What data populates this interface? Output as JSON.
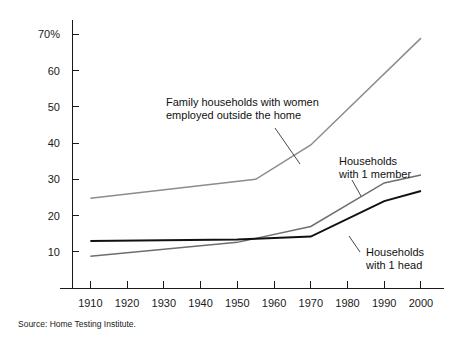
{
  "source_note": "Source: Home Testing Institute.",
  "chart_data": {
    "type": "line",
    "title": "",
    "subtitle": "",
    "xlabel": "",
    "ylabel": "",
    "xlim": [
      1905,
      2003
    ],
    "ylim": [
      0,
      74
    ],
    "grid": false,
    "legend_position": "inline-annotations",
    "x_ticks": [
      1910,
      1920,
      1930,
      1940,
      1950,
      1960,
      1970,
      1980,
      1990,
      2000
    ],
    "x_tick_labels": [
      "1910",
      "1920",
      "1930",
      "1940",
      "1950",
      "1960",
      "1970",
      "1980",
      "1990",
      "2000"
    ],
    "y_ticks": [
      10,
      20,
      30,
      40,
      50,
      60,
      70
    ],
    "y_tick_labels": [
      "10",
      "20",
      "30",
      "40",
      "50",
      "60",
      "70%"
    ],
    "series": [
      {
        "name": "Family households with women employed outside the home",
        "color": "#8c8c8c",
        "width": 1.5,
        "x": [
          1910,
          1955,
          1970,
          2000
        ],
        "values": [
          24.8,
          30.0,
          39.5,
          69.0
        ]
      },
      {
        "name": "Households with 1 member",
        "color": "#6e6e6e",
        "width": 1.5,
        "x": [
          1910,
          1950,
          1970,
          1990,
          2000
        ],
        "values": [
          8.8,
          12.6,
          17.0,
          29.0,
          31.2
        ]
      },
      {
        "name": "Households with 1 head",
        "color": "#111111",
        "width": 2.0,
        "x": [
          1910,
          1950,
          1970,
          1990,
          2000
        ],
        "values": [
          13.0,
          13.4,
          14.2,
          24.0,
          26.8
        ]
      }
    ],
    "annotations": [
      {
        "id": "annotation-family-households",
        "lines": [
          "Family households with women",
          "employed outside the home"
        ],
        "text_x": 166,
        "text_y": 106,
        "anchor": "start",
        "leader": [
          [
            275,
            128
          ],
          [
            300,
            164
          ]
        ]
      },
      {
        "id": "annotation-one-member",
        "lines": [
          "Households",
          "with 1 member"
        ],
        "text_x": 339,
        "text_y": 165,
        "anchor": "start",
        "leader": [
          [
            352,
            180
          ],
          [
            361,
            196
          ]
        ]
      },
      {
        "id": "annotation-one-head",
        "lines": [
          "Households",
          "with 1 head"
        ],
        "text_x": 366,
        "text_y": 256,
        "anchor": "start",
        "leader": [
          [
            360,
            252
          ],
          [
            349,
            236
          ]
        ]
      }
    ]
  }
}
